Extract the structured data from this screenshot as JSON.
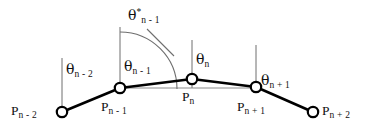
{
  "figure": {
    "type": "geometric-diagram",
    "title": "",
    "background_color": "#ffffff",
    "stroke_color": "#111111",
    "thin_stroke_color": "#6e6e6e",
    "points": [
      {
        "id": "p-n-minus-2",
        "base": "P",
        "sub": "n - 2",
        "label": "P n - 2",
        "x": 62,
        "y": 112,
        "label_x": 11,
        "label_y": 104,
        "label_align": "left"
      },
      {
        "id": "p-n-minus-1",
        "base": "P",
        "sub": "n - 1",
        "label": "P n - 1",
        "x": 120,
        "y": 88,
        "label_x": 101,
        "label_y": 96,
        "label_align": "left"
      },
      {
        "id": "p-n",
        "base": "P",
        "sub": "n",
        "label": "P n",
        "x": 192,
        "y": 79,
        "label_x": 182,
        "label_y": 88,
        "label_align": "left"
      },
      {
        "id": "p-n-plus-1",
        "base": "P",
        "sub": "n + 1",
        "label": "P n + 1",
        "x": 256,
        "y": 87,
        "label_x": 237,
        "label_y": 96,
        "label_align": "left"
      },
      {
        "id": "p-n-plus-2",
        "base": "P",
        "sub": "n + 2",
        "label": "P n + 2",
        "x": 313,
        "y": 112,
        "label_x": 322,
        "label_y": 104,
        "label_align": "left"
      }
    ],
    "angles": [
      {
        "id": "theta-n-minus-2",
        "base": "θ",
        "sup": "",
        "sub": "n - 2",
        "label": "θ n - 2",
        "x": 66,
        "y": 62
      },
      {
        "id": "theta-n-minus-1",
        "base": "θ",
        "sup": "",
        "sub": "n - 1",
        "label": "θ n - 1",
        "x": 124,
        "y": 59
      },
      {
        "id": "theta-n",
        "base": "θ",
        "sup": "",
        "sub": "n",
        "label": "θ n",
        "x": 196,
        "y": 52
      },
      {
        "id": "theta-n-plus-1",
        "base": "θ",
        "sup": "",
        "sub": "n + 1",
        "label": "θ n + 1",
        "x": 261,
        "y": 73
      },
      {
        "id": "theta-star-n-minus-1",
        "base": "θ",
        "sup": "*",
        "sub": "n - 1",
        "label": "θ* n - 1",
        "x": 128,
        "y": 8
      }
    ],
    "verticals": [
      {
        "id": "vertical-at-p-n-minus-2",
        "x": 62,
        "y_top": 58,
        "y_bottom": 112
      },
      {
        "id": "vertical-at-p-n-minus-1",
        "x": 120,
        "y_top": 27,
        "y_bottom": 89
      },
      {
        "id": "vertical-at-p-n",
        "x": 192,
        "y_top": 40,
        "y_bottom": 88
      },
      {
        "id": "vertical-at-p-n-plus-1",
        "x": 256,
        "y_top": 45,
        "y_bottom": 88
      }
    ],
    "polyline": {
      "id": "chain-polyline",
      "points": "62,112 120,88 192,79 256,87 313,112"
    },
    "reference_line": {
      "id": "horizontal-reference-line",
      "x1": 120,
      "y1": 88,
      "x2": 256,
      "y2": 88
    },
    "arc": {
      "id": "theta-star-arc",
      "description": "large arc from vertical at P n-1 sweeping to segment toward P n",
      "path": "M 120,32 A 57,57 0 0 1 177,89"
    },
    "tick": {
      "id": "arc-tick-mark",
      "x1": 147,
      "y1": 29,
      "x2": 174,
      "y2": 56
    }
  }
}
